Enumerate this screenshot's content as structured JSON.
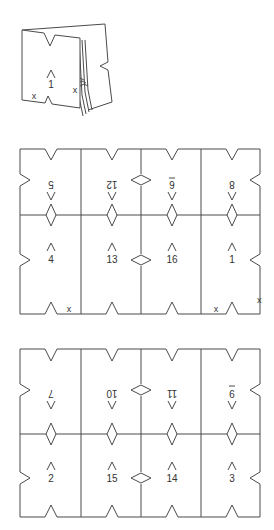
{
  "figure": {
    "booklet": {
      "page_label": "1",
      "x_marks": [
        "x",
        "x"
      ]
    },
    "sheet_a": {
      "top_row": [
        {
          "page": "5",
          "rotated": true,
          "underline": false
        },
        {
          "page": "12",
          "rotated": true,
          "underline": false
        },
        {
          "page": "6",
          "rotated": true,
          "underline": true
        },
        {
          "page": "8",
          "rotated": true,
          "underline": false
        }
      ],
      "bottom_row": [
        {
          "page": "4",
          "rotated": false,
          "underline": false
        },
        {
          "page": "13",
          "rotated": false,
          "underline": false
        },
        {
          "page": "16",
          "rotated": false,
          "underline": false
        },
        {
          "page": "1",
          "rotated": false,
          "underline": false
        }
      ],
      "x_marks": [
        "x",
        "x",
        "x"
      ]
    },
    "sheet_b": {
      "top_row": [
        {
          "page": "7",
          "rotated": true,
          "underline": false
        },
        {
          "page": "10",
          "rotated": true,
          "underline": false
        },
        {
          "page": "11",
          "rotated": true,
          "underline": false
        },
        {
          "page": "9",
          "rotated": true,
          "underline": true
        }
      ],
      "bottom_row": [
        {
          "page": "2",
          "rotated": false,
          "underline": false
        },
        {
          "page": "15",
          "rotated": false,
          "underline": false
        },
        {
          "page": "14",
          "rotated": false,
          "underline": false
        },
        {
          "page": "3",
          "rotated": false,
          "underline": false
        }
      ]
    }
  }
}
